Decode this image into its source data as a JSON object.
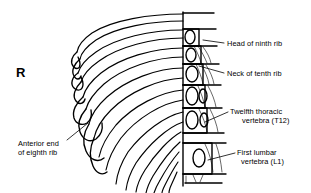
{
  "figure": {
    "kind": "anatomical-line-drawing",
    "background_color": "#ffffff",
    "line_color": "#000000",
    "side_marker": "R"
  },
  "labels": {
    "anterior_end_eighth_rib": {
      "line1": "Anterior end",
      "line2": "of eighth rib"
    },
    "head_ninth_rib": {
      "line1": "Head of ninth rib"
    },
    "neck_tenth_rib": {
      "line1": "Neck of tenth rib"
    },
    "twelfth_thoracic": {
      "line1": "Twelfth thoracic",
      "line2": "vertebra (T12)"
    },
    "first_lumbar": {
      "line1": "First lumbar",
      "line2": "vertebra (L1)"
    }
  }
}
